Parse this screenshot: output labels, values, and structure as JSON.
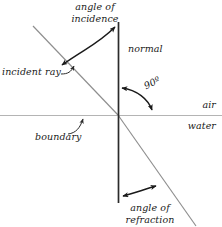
{
  "figure": {
    "labels": {
      "angle_of_incidence_line1": "angle of",
      "angle_of_incidence_line2": "incidence",
      "normal": "normal",
      "incident_ray": "incident ray",
      "right_angle": "90º",
      "air": "air",
      "water": "water",
      "boundary": "boundary",
      "angle_of_refraction_line1": "angle of",
      "angle_of_refraction_line2": "refraction"
    },
    "colors": {
      "ray": "#8e8e8e",
      "boundary": "#b4b4b4",
      "normal": "#2b2b2b",
      "annotation": "#1a1a1a",
      "text": "#1a1a1a",
      "background": "#ffffff"
    }
  }
}
